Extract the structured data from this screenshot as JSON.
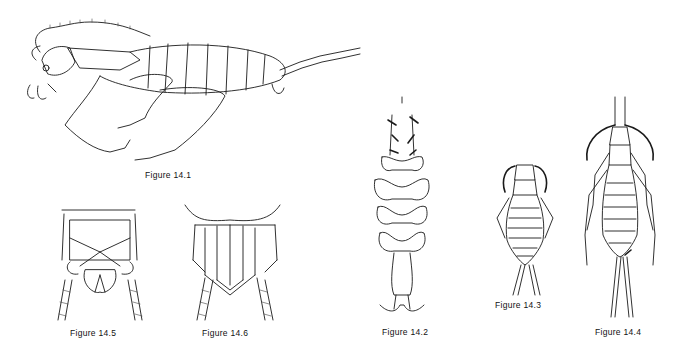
{
  "page": {
    "figures": [
      {
        "id": "14.1",
        "caption": "Figure 14.1",
        "subject": "insect lateral view"
      },
      {
        "id": "14.2",
        "caption": "Figure 14.2",
        "subject": "insect dorsal view, lobed body"
      },
      {
        "id": "14.3",
        "caption": "Figure 14.3",
        "subject": "small insect dorsal view"
      },
      {
        "id": "14.4",
        "caption": "Figure 14.4",
        "subject": "large insect dorsal view"
      },
      {
        "id": "14.5",
        "caption": "Figure 14.5",
        "subject": "abdomen tip detail"
      },
      {
        "id": "14.6",
        "caption": "Figure 14.6",
        "subject": "abdomen tip detail"
      }
    ]
  }
}
